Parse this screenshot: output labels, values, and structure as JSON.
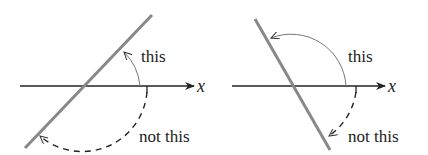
{
  "figure": {
    "panels": [
      {
        "id": "left",
        "axis_label": "x",
        "correct_label": "this",
        "wrong_label": "not this",
        "line_slope": "positive"
      },
      {
        "id": "right",
        "axis_label": "x",
        "correct_label": "this",
        "wrong_label": "not this",
        "line_slope": "negative"
      }
    ],
    "colors": {
      "line": "#888888",
      "axis": "#222222",
      "arc": "#777777"
    }
  }
}
